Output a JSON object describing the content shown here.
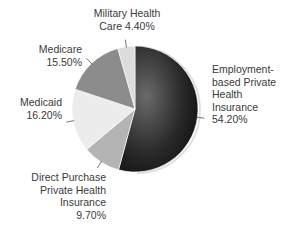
{
  "chart_data": {
    "type": "pie",
    "title": "",
    "slices": [
      {
        "name": "Employment-based Private Health Insurance",
        "value": 54.2,
        "label_lines": [
          "Employment-",
          "based Private",
          "Health",
          "Insurance",
          "54.20%"
        ],
        "color": "#1e1e1e"
      },
      {
        "name": "Direct Purchase Private Health Insurance",
        "value": 9.7,
        "label_lines": [
          "Direct Purchase",
          "Private Health",
          "Insurance",
          "9.70%"
        ],
        "color": "#b4b4b4"
      },
      {
        "name": "Medicaid",
        "value": 16.2,
        "label_lines": [
          "Medicaid",
          "16.20%"
        ],
        "color": "#ececec"
      },
      {
        "name": "Medicare",
        "value": 15.5,
        "label_lines": [
          "Medicare",
          "15.50%"
        ],
        "color": "#8c8c8c"
      },
      {
        "name": "Military Health Care",
        "value": 4.4,
        "label_lines": [
          "Military Health",
          "Care 4.40%"
        ],
        "color": "#dcdcdc"
      }
    ],
    "start_angle": "12 o'clock",
    "direction": "clockwise",
    "legend": "none (direct labels with leader lines)"
  }
}
